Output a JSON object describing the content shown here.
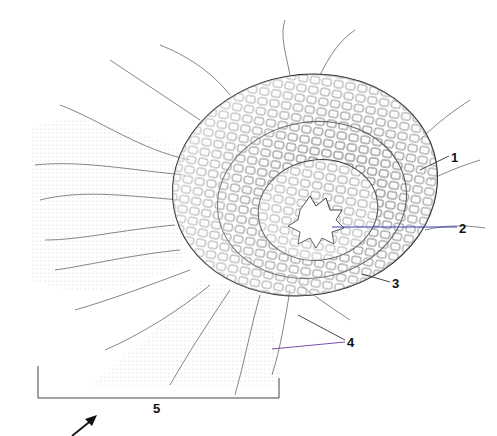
{
  "figure": {
    "labels": [
      {
        "id": "1",
        "text": "1",
        "x": 451,
        "y": 151
      },
      {
        "id": "2",
        "text": "2",
        "x": 459,
        "y": 222
      },
      {
        "id": "3",
        "text": "3",
        "x": 392,
        "y": 277
      },
      {
        "id": "4",
        "text": "4",
        "x": 347,
        "y": 336
      },
      {
        "id": "5",
        "text": "5",
        "x": 153,
        "y": 402
      }
    ],
    "leader_colors": {
      "default": "#333333",
      "label_2": "#2a2ab0",
      "label_4": "#6a3aa0"
    },
    "scale_bracket": {
      "x1": 38,
      "x2": 279,
      "y": 398
    },
    "arrow": {
      "from": [
        72,
        436
      ],
      "to": [
        97,
        416
      ]
    }
  }
}
